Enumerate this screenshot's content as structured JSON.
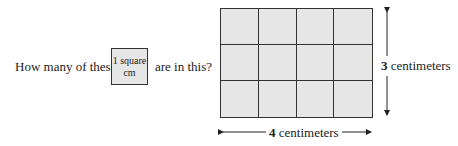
{
  "question": {
    "prefix": "How many of these",
    "suffix": "are in this?"
  },
  "unit_square": {
    "line1": "1 square",
    "line2": "cm"
  },
  "rectangle": {
    "columns": 4,
    "rows": 3,
    "fill_color": "#e6e6e6",
    "line_color": "#333333"
  },
  "dimensions": {
    "height_value": "3",
    "height_unit": "centimeters",
    "width_value": "4",
    "width_unit": "centimeters"
  }
}
